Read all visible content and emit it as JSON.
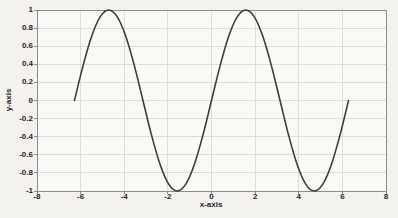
{
  "chart_data": {
    "type": "line",
    "title": "",
    "xlabel": "x-axis",
    "ylabel": "y-axis",
    "xlim": [
      -8,
      8
    ],
    "ylim": [
      -1,
      1
    ],
    "grid": true,
    "legend": false,
    "x_ticks": [
      -8,
      -6,
      -4,
      -2,
      0,
      2,
      4,
      6,
      8
    ],
    "x_tick_labels": [
      "-8",
      "-6",
      "-4",
      "-2",
      "0",
      "2",
      "4",
      "6",
      "8"
    ],
    "y_ticks": [
      1,
      0.8,
      0.6,
      0.4,
      0.2,
      0,
      -0.2,
      -0.4,
      -0.6,
      -0.8,
      -1
    ],
    "y_tick_labels": [
      "1",
      "0.8",
      "0.6",
      "0.4",
      "0.2",
      "0",
      "-0.2",
      "-0.4",
      "-0.6",
      "-0.8",
      "-1"
    ],
    "colors": {
      "line": "#3d3d3d",
      "grid": "#dcdcda",
      "axis": "#8c8c8c",
      "text": "#1f1f1f",
      "plot_bg": "#faf9f6",
      "figure_bg": "#f4f2ee"
    },
    "series": [
      {
        "name": "sin(x)",
        "function": "y = sin(x)",
        "x_range": [
          -6.2832,
          6.2832
        ],
        "points": [
          [
            -6.2832,
            0
          ],
          [
            -5.8905,
            0.3827
          ],
          [
            -5.4978,
            0.7071
          ],
          [
            -5.1051,
            0.9239
          ],
          [
            -4.7124,
            1
          ],
          [
            -4.3197,
            0.9239
          ],
          [
            -3.927,
            0.7071
          ],
          [
            -3.5343,
            0.3827
          ],
          [
            -3.1416,
            0
          ],
          [
            -2.7489,
            -0.3827
          ],
          [
            -2.3562,
            -0.7071
          ],
          [
            -1.9635,
            -0.9239
          ],
          [
            -1.5708,
            -1
          ],
          [
            -1.1781,
            -0.9239
          ],
          [
            -0.7854,
            -0.7071
          ],
          [
            -0.3927,
            -0.3827
          ],
          [
            0,
            0
          ],
          [
            0.3927,
            0.3827
          ],
          [
            0.7854,
            0.7071
          ],
          [
            1.1781,
            0.9239
          ],
          [
            1.5708,
            1
          ],
          [
            1.9635,
            0.9239
          ],
          [
            2.3562,
            0.7071
          ],
          [
            2.7489,
            0.3827
          ],
          [
            3.1416,
            0
          ],
          [
            3.5343,
            -0.3827
          ],
          [
            3.927,
            -0.7071
          ],
          [
            4.3197,
            -0.9239
          ],
          [
            4.7124,
            -1
          ],
          [
            5.1051,
            -0.9239
          ],
          [
            5.4978,
            -0.7071
          ],
          [
            5.8905,
            -0.3827
          ],
          [
            6.2832,
            0
          ]
        ]
      }
    ]
  }
}
